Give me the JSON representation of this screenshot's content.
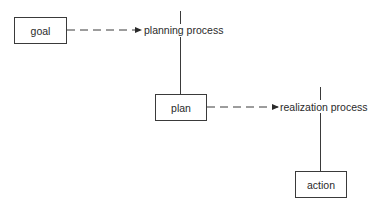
{
  "diagram": {
    "type": "flow",
    "nodes": [
      {
        "id": "goal",
        "label": "goal",
        "kind": "box"
      },
      {
        "id": "planning",
        "label": "planning process",
        "kind": "process"
      },
      {
        "id": "plan",
        "label": "plan",
        "kind": "box"
      },
      {
        "id": "realization",
        "label": "realization process",
        "kind": "process"
      },
      {
        "id": "action",
        "label": "action",
        "kind": "box"
      }
    ],
    "edges": [
      {
        "from": "goal",
        "to": "planning",
        "style": "dashed-arrow"
      },
      {
        "from": "planning",
        "to": "plan",
        "style": "solid-line"
      },
      {
        "from": "plan",
        "to": "realization",
        "style": "dashed-arrow"
      },
      {
        "from": "realization",
        "to": "action",
        "style": "solid-line"
      }
    ],
    "colors": {
      "line": "#3a3a3a",
      "text": "#2a2a2a",
      "background": "#ffffff"
    }
  }
}
